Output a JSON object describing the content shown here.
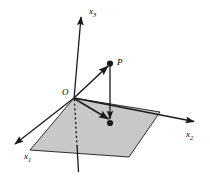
{
  "figure": {
    "type": "3d-coordinate-diagram",
    "background_color": "#ffffff",
    "stroke_color": "#1a1a1a",
    "plane_fill_color": "#c8c8c8",
    "plane_edge_color": "#1a1a1a",
    "labels": {
      "x3": "x",
      "x3_sub": "3",
      "x2": "x",
      "x2_sub": "2",
      "x1": "x",
      "x1_sub": "1",
      "point": "P",
      "origin": "O"
    },
    "geometry": {
      "origin": [
        74,
        98
      ],
      "x3_axis_tip": [
        81,
        15
      ],
      "x3_axis_bottom": [
        78,
        172
      ],
      "x1_axis_tip": [
        13,
        146
      ],
      "x2_axis_tip": [
        196,
        122
      ],
      "point_P": [
        110,
        63
      ],
      "projection_point": [
        110,
        123
      ],
      "plane_corners": [
        [
          74,
          98
        ],
        [
          160,
          112
        ],
        [
          129,
          157
        ],
        [
          30,
          150
        ]
      ],
      "dashed_segment": [
        [
          74,
          100
        ],
        [
          77,
          146
        ]
      ]
    },
    "elements": [
      {
        "name": "x3-axis",
        "kind": "arrow"
      },
      {
        "name": "x1-axis",
        "kind": "arrow"
      },
      {
        "name": "x2-axis",
        "kind": "arrow"
      },
      {
        "name": "plane-x1x2",
        "kind": "shaded-parallelogram"
      },
      {
        "name": "vector-O-to-P",
        "kind": "arrow"
      },
      {
        "name": "vector-O-to-projection",
        "kind": "arrow"
      },
      {
        "name": "vector-P-to-projection",
        "kind": "arrow"
      },
      {
        "name": "hidden-axis-dashed",
        "kind": "dashed-line"
      },
      {
        "name": "point-P-dot",
        "kind": "dot"
      },
      {
        "name": "projection-dot",
        "kind": "dot"
      }
    ]
  }
}
